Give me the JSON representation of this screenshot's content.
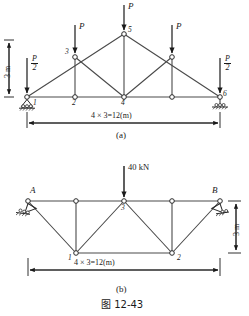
{
  "figure": {
    "caption": "图 12-43",
    "sub_a": "(a)",
    "sub_b": "(b)"
  },
  "diagram_a": {
    "name": "triangular-roof-truss",
    "span_label": "4 × 3=12(m)",
    "height_label": "3 m",
    "loads": [
      {
        "label": "P/2",
        "numerator": "P",
        "denominator": "2",
        "at_node": "1"
      },
      {
        "label": "P",
        "at_node": "3"
      },
      {
        "label": "P",
        "at_node": "5"
      },
      {
        "label": "P",
        "at_node": "right-upper"
      },
      {
        "label": "P/2",
        "numerator": "P",
        "denominator": "2",
        "at_node": "6"
      }
    ],
    "nodes": [
      {
        "id": "1",
        "label": "1"
      },
      {
        "id": "2",
        "label": "2"
      },
      {
        "id": "4",
        "label": "4"
      },
      {
        "id": "6",
        "label": "6"
      },
      {
        "id": "3",
        "label": "3"
      },
      {
        "id": "5",
        "label": "5"
      }
    ],
    "supports": [
      {
        "type": "pin",
        "at_node": "1"
      },
      {
        "type": "roller",
        "at_node": "6"
      }
    ]
  },
  "diagram_b": {
    "name": "trapezoidal-truss",
    "span_label": "4 × 3=12(m)",
    "height_label": "3 m",
    "load": {
      "label": "40 kN",
      "at_node": "3"
    },
    "nodes": [
      {
        "id": "A",
        "label": "A"
      },
      {
        "id": "B",
        "label": "B"
      },
      {
        "id": "1",
        "label": "1"
      },
      {
        "id": "2",
        "label": "2"
      },
      {
        "id": "3",
        "label": "3"
      }
    ],
    "supports": [
      {
        "type": "pin",
        "at_node": "A"
      },
      {
        "type": "roller",
        "at_node": "B"
      }
    ]
  },
  "colors": {
    "line": "#3a3a3a",
    "text": "#1a1a1a",
    "background": "#ffffff"
  }
}
